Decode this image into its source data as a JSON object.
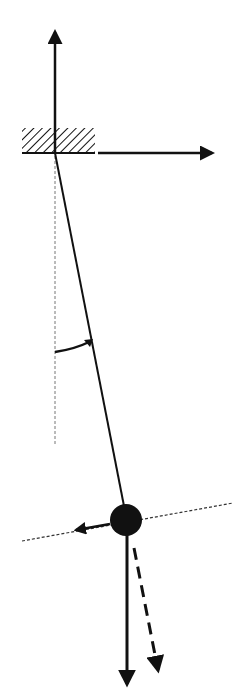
{
  "diagram": {
    "colors": {
      "ink": "#111111",
      "guide": "#666666",
      "background": "#ffffff"
    },
    "elements": [
      "support-block",
      "vertical-axis-arrow",
      "horizontal-axis-arrow",
      "vertical-reference-line",
      "pendulum-string",
      "angle-arc",
      "pendulum-bob",
      "tangent-line",
      "tangential-force-arrow",
      "weight-force-arrow",
      "component-force-arrow"
    ]
  }
}
